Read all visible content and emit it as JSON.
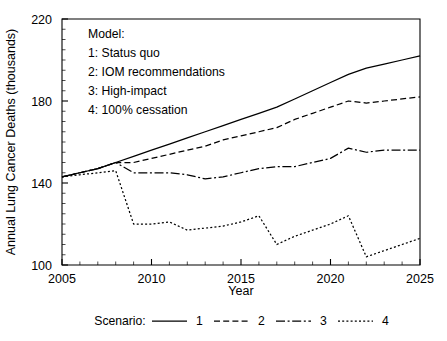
{
  "chart_data": {
    "type": "line",
    "title": "",
    "xlabel": "Year",
    "ylabel": "Annual Lung Cancer Deaths (thousands)",
    "xlim": [
      2005,
      2025
    ],
    "ylim": [
      100,
      220
    ],
    "xticks": [
      2005,
      2010,
      2015,
      2020,
      2025
    ],
    "yticks": [
      100,
      140,
      180,
      220
    ],
    "x_minor_step": 1,
    "y_minor_step": 5,
    "grid": false,
    "legend_position": "below-axes",
    "x": [
      2005,
      2006,
      2007,
      2008,
      2009,
      2010,
      2011,
      2012,
      2013,
      2014,
      2015,
      2016,
      2017,
      2018,
      2019,
      2020,
      2021,
      2022,
      2023,
      2024,
      2025
    ],
    "series": [
      {
        "name": "1",
        "label": "Status quo",
        "linestyle": "solid",
        "color": "#000000",
        "values": [
          143,
          145,
          147,
          150,
          153,
          156,
          159,
          162,
          165,
          168,
          171,
          174,
          177,
          181,
          185,
          189,
          193,
          196,
          198,
          200,
          202
        ]
      },
      {
        "name": "2",
        "label": "IOM recommendations",
        "linestyle": "dashed",
        "color": "#000000",
        "values": [
          143,
          145,
          147,
          150,
          150,
          152,
          154,
          156,
          158,
          161,
          163,
          165,
          167,
          171,
          174,
          177,
          180,
          179,
          180,
          181,
          182
        ]
      },
      {
        "name": "3",
        "label": "High-impact",
        "linestyle": "dashdot",
        "color": "#000000",
        "values": [
          143,
          145,
          147,
          150,
          145,
          145,
          145,
          144,
          142,
          143,
          145,
          147,
          148,
          148,
          150,
          152,
          157,
          155,
          156,
          156,
          156
        ]
      },
      {
        "name": "4",
        "label": "100% cessation",
        "linestyle": "dotted",
        "color": "#000000",
        "values": [
          143,
          144,
          145,
          146,
          120,
          120,
          121,
          117,
          118,
          119,
          121,
          124,
          110,
          114,
          117,
          120,
          124,
          104,
          107,
          110,
          113
        ]
      }
    ]
  },
  "model_box": {
    "heading": "Model:",
    "entries": [
      "1: Status quo",
      "2: IOM recommendations",
      "3: High-impact",
      "4: 100% cessation"
    ]
  },
  "legend": {
    "title": "Scenario:",
    "items": [
      {
        "label": "1",
        "linestyle": "solid"
      },
      {
        "label": "2",
        "linestyle": "dashed"
      },
      {
        "label": "3",
        "linestyle": "dashdot"
      },
      {
        "label": "4",
        "linestyle": "dotted"
      }
    ]
  }
}
